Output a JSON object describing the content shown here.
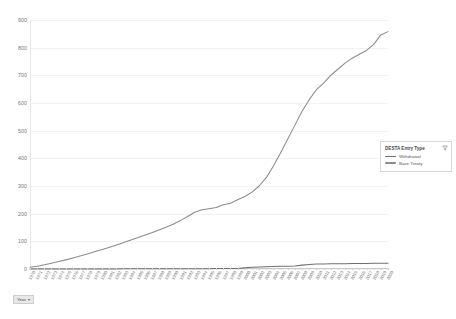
{
  "chart_data": {
    "type": "line",
    "title": "",
    "xlabel": "Year",
    "ylabel": "",
    "ylim": [
      0,
      900
    ],
    "ytick_values": [
      0,
      100,
      200,
      300,
      400,
      500,
      600,
      700,
      800,
      900
    ],
    "ytick_labels": [
      "0",
      "100",
      "200",
      "300",
      "400",
      "500",
      "600",
      "700",
      "800",
      "900"
    ],
    "grid": true,
    "legend_position": "right",
    "categories": [
      "1970",
      "1971",
      "1972",
      "1973",
      "1974",
      "1975",
      "1976",
      "1977",
      "1978",
      "1979",
      "1980",
      "1981",
      "1982",
      "1983",
      "1984",
      "1985",
      "1986",
      "1987",
      "1988",
      "1989",
      "1990",
      "1991",
      "1992",
      "1993",
      "1994",
      "1995",
      "1996",
      "1997",
      "1998",
      "1999",
      "2000",
      "2001",
      "2002",
      "2003",
      "2004",
      "2005",
      "2006",
      "2007",
      "2008",
      "2009",
      "2010",
      "2011",
      "2012",
      "2013",
      "2014",
      "2015",
      "2016",
      "2017",
      "2018",
      "2019",
      "2020"
    ],
    "series": [
      {
        "name": "Base Treaty",
        "color": "#8b8b8b",
        "values": [
          6,
          10,
          15,
          21,
          27,
          33,
          40,
          47,
          54,
          62,
          70,
          78,
          86,
          95,
          104,
          113,
          122,
          131,
          141,
          151,
          162,
          175,
          190,
          205,
          214,
          218,
          222,
          232,
          238,
          250,
          262,
          278,
          300,
          330,
          372,
          420,
          470,
          520,
          570,
          612,
          648,
          672,
          700,
          722,
          744,
          762,
          776,
          790,
          812,
          846,
          858
        ]
      },
      {
        "name": "Withdrawal",
        "color": "#707070",
        "values": [
          0,
          0,
          0,
          0,
          0,
          0,
          0,
          0,
          0,
          0,
          0,
          0,
          0,
          1,
          1,
          1,
          1,
          1,
          1,
          1,
          1,
          1,
          1,
          1,
          1,
          1,
          2,
          2,
          2,
          2,
          4,
          6,
          7,
          8,
          9,
          10,
          10,
          11,
          14,
          16,
          18,
          18,
          19,
          19,
          19,
          20,
          20,
          20,
          21,
          21,
          21
        ]
      }
    ]
  },
  "legend": {
    "title": "DESTA Entry Type",
    "filter_icon": "filter-icon",
    "items": [
      {
        "label": "Withdrawal",
        "color": "#707070"
      },
      {
        "label": "Base Treaty",
        "color": "#8b8b8b"
      }
    ]
  },
  "axis_field": {
    "label": "Year",
    "caret": "▾"
  }
}
